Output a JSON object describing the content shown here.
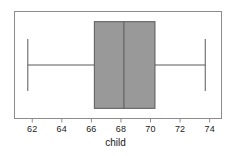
{
  "chart_data": {
    "type": "box",
    "orientation": "horizontal",
    "title": "",
    "xlabel": "child",
    "ylabel": "",
    "xlim": [
      60.8,
      74.8
    ],
    "xticks": [
      62,
      64,
      66,
      68,
      70,
      72,
      74
    ],
    "xtick_labels": [
      "62",
      "64",
      "66",
      "68",
      "70",
      "72",
      "74"
    ],
    "grid": false,
    "legend": null,
    "categories": [
      "child"
    ],
    "series": [
      {
        "name": "child",
        "whisker_low": 61.7,
        "q1": 66.2,
        "median": 68.2,
        "q3": 70.3,
        "whisker_high": 73.7,
        "outliers": []
      }
    ],
    "box_fill_color": "#999999",
    "box_edge_color": "#595959",
    "whisker_color": "#595959",
    "median_color": "#595959",
    "frame_color": "#8c8c8c",
    "background_color": "#ffffff"
  },
  "axis": {
    "label": "child",
    "ticks": [
      {
        "value": 62,
        "label": "62"
      },
      {
        "value": 64,
        "label": "64"
      },
      {
        "value": 66,
        "label": "66"
      },
      {
        "value": 68,
        "label": "68"
      },
      {
        "value": 70,
        "label": "70"
      },
      {
        "value": 72,
        "label": "72"
      },
      {
        "value": 74,
        "label": "74"
      }
    ]
  }
}
